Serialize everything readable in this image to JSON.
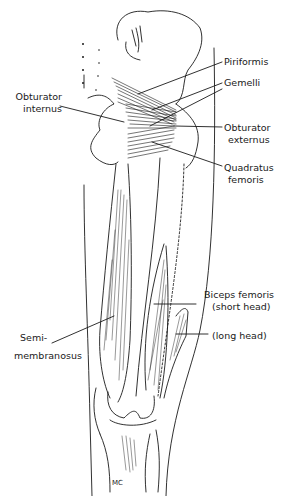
{
  "figure": {
    "labels": [
      {
        "id": "piriformis",
        "text": "Piriformis"
      },
      {
        "id": "gemelli",
        "text": "Gemelli"
      },
      {
        "id": "obturator_internus_1",
        "text": "Obturator"
      },
      {
        "id": "obturator_internus_2",
        "text": "internus"
      },
      {
        "id": "obturator_externus_1",
        "text": "Obturator"
      },
      {
        "id": "obturator_externus_2",
        "text": "externus"
      },
      {
        "id": "quadratus_femoris_1",
        "text": "Quadratus"
      },
      {
        "id": "quadratus_femoris_2",
        "text": "femoris"
      },
      {
        "id": "biceps_femoris_1",
        "text": "Biceps femoris"
      },
      {
        "id": "biceps_femoris_2",
        "text": "(short head)"
      },
      {
        "id": "long_head",
        "text": "(long head)"
      },
      {
        "id": "semimembranosus_1",
        "text": "Semi-"
      },
      {
        "id": "semimembranosus_2",
        "text": "membranosus"
      }
    ],
    "signature": "MC"
  },
  "colors": {
    "ink": "#1a1a1a",
    "background": "#ffffff"
  }
}
